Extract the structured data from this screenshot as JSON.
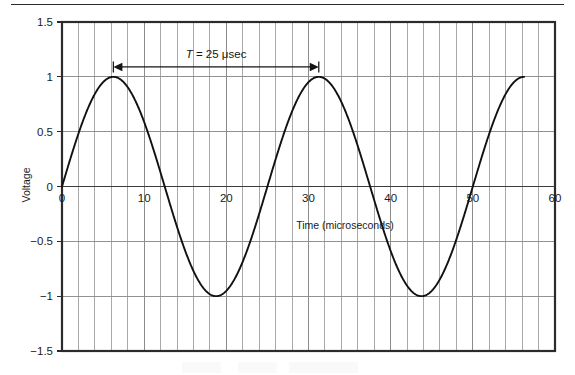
{
  "chart_data": {
    "type": "line",
    "title": "",
    "subtitle": "",
    "xlabel": "Time (microseconds)",
    "ylabel": "Voltage",
    "xlim": [
      0,
      60
    ],
    "ylim": [
      -1.5,
      1.5
    ],
    "xticks": [
      0,
      10,
      20,
      30,
      40,
      50,
      60
    ],
    "xtick_labels": [
      "0",
      "10",
      "20",
      "30",
      "40",
      "50",
      "60"
    ],
    "yticks": [
      1.5,
      1,
      0.5,
      0,
      -0.5,
      -1,
      -1.5
    ],
    "ytick_labels": [
      "1.5",
      "1",
      "0.5",
      "0",
      "−0.5",
      "−1",
      "−1.5"
    ],
    "grid": {
      "vertical": true,
      "vertical_step": 2,
      "horizontal": true,
      "horizontal_step": 0.5,
      "color": "#8c8c8c"
    },
    "legend": {
      "visible": false,
      "position": "none"
    },
    "series": [
      {
        "name": "Voltage waveform",
        "color": "#111111",
        "line_width": 1.9,
        "equation": "v(t) = sin(2πt / 25)",
        "amplitude": 1,
        "period": 25,
        "phase": 0,
        "x_start": 0,
        "x_end": 56.25,
        "points": [
          {
            "x": 0,
            "y": 0.0
          },
          {
            "x": 3.125,
            "y": 0.707
          },
          {
            "x": 6.25,
            "y": 1.0
          },
          {
            "x": 9.375,
            "y": 0.707
          },
          {
            "x": 12.5,
            "y": 0.0
          },
          {
            "x": 15.625,
            "y": -0.707
          },
          {
            "x": 18.75,
            "y": -1.0
          },
          {
            "x": 21.875,
            "y": -0.707
          },
          {
            "x": 25,
            "y": 0.0
          },
          {
            "x": 28.125,
            "y": 0.707
          },
          {
            "x": 31.25,
            "y": 1.0
          },
          {
            "x": 34.375,
            "y": 0.707
          },
          {
            "x": 37.5,
            "y": 0.0
          },
          {
            "x": 40.625,
            "y": -0.707
          },
          {
            "x": 43.75,
            "y": -1.0
          },
          {
            "x": 46.875,
            "y": -0.707
          },
          {
            "x": 50,
            "y": 0.0
          },
          {
            "x": 53.125,
            "y": 0.707
          },
          {
            "x": 56.25,
            "y": 0.95
          }
        ]
      }
    ],
    "annotations": [
      {
        "id": "period-measure",
        "text_prefix": "T",
        "text_rest": " = 25 μsec",
        "full_text": "T = 25 μsec",
        "kind": "double-headed-arrow",
        "x_start": 6.25,
        "x_end": 31.25,
        "y": 1.09,
        "color": "#141414"
      }
    ],
    "plot_frame": {
      "border_color": "#2b2b2b",
      "border_width": 2,
      "zero_line_color": "#3c3c3c",
      "background": "#ffffff"
    }
  },
  "decorations": {
    "top_rule_present": true,
    "top_rule_color": "#2b2b2b"
  }
}
